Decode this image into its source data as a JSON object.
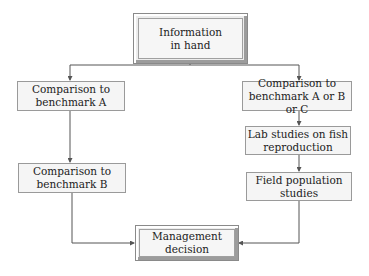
{
  "diagram": {
    "type": "flowchart",
    "nodes": {
      "information": {
        "line1": "Information",
        "line2": "in hand"
      },
      "benchmark_a": {
        "line1": "Comparison to",
        "line2": "benchmark A"
      },
      "benchmark_b": {
        "line1": "Comparison to",
        "line2": "benchmark B"
      },
      "benchmark_abc": {
        "line1": "Comparison to",
        "line2": "benchmark A or B or C"
      },
      "lab_studies": {
        "line1": "Lab studies on fish",
        "line2": "reproduction"
      },
      "field_studies": {
        "line1": "Field population",
        "line2": "studies"
      },
      "management": {
        "line1": "Management",
        "line2": "decision"
      }
    },
    "edges": [
      {
        "from": "information",
        "to": "benchmark_a"
      },
      {
        "from": "information",
        "to": "benchmark_abc"
      },
      {
        "from": "benchmark_a",
        "to": "benchmark_b"
      },
      {
        "from": "benchmark_b",
        "to": "management"
      },
      {
        "from": "benchmark_abc",
        "to": "lab_studies"
      },
      {
        "from": "lab_studies",
        "to": "field_studies"
      },
      {
        "from": "field_studies",
        "to": "management"
      }
    ],
    "colors": {
      "line": "#555555",
      "box_fill": "#f5f5f5",
      "box_border": "#9a9a9a"
    }
  }
}
